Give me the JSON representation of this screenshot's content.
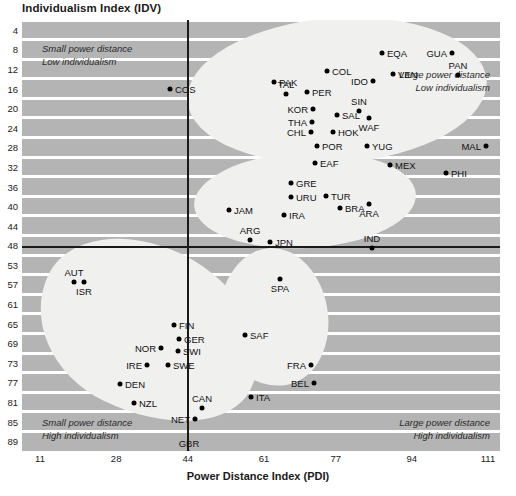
{
  "chart_data": {
    "type": "scatter",
    "title": "Individualism Index (IDV)",
    "xlabel": "Power Distance Index (PDI)",
    "ylabel": "Individualism Index (IDV)",
    "xticks": [
      "11",
      "28",
      "44",
      "61",
      "77",
      "94",
      "111"
    ],
    "yticks": [
      "4",
      "8",
      "12",
      "16",
      "20",
      "24",
      "28",
      "32",
      "36",
      "40",
      "44",
      "48",
      "53",
      "57",
      "61",
      "65",
      "69",
      "73",
      "77",
      "81",
      "85",
      "89"
    ],
    "xlim": [
      11,
      111
    ],
    "ylim": [
      4,
      89
    ],
    "grid": "horizontal-banded",
    "legend": "none",
    "annotations": [
      {
        "id": "q-top-left",
        "line1": "Small power distance",
        "line2": "Low individualism",
        "align": "left"
      },
      {
        "id": "q-top-right",
        "line1": "Large power distance",
        "line2": "Low individualism",
        "align": "right"
      },
      {
        "id": "q-bottom-left",
        "line1": "Small power distance",
        "line2": "High individualism",
        "align": "left"
      },
      {
        "id": "q-bottom-right",
        "line1": "Large power distance",
        "line2": "High individualism",
        "align": "right"
      }
    ],
    "divider_x": 44,
    "divider_y": 48,
    "clusters": [
      {
        "name": "large-power-distance-low-individualism",
        "members": [
          "PAK",
          "TAL",
          "PER",
          "COL",
          "EQA",
          "IDO",
          "VEN",
          "GUA",
          "PAN",
          "KOR",
          "SIN",
          "SAL",
          "THA",
          "WAF",
          "CHL",
          "HOK",
          "POR",
          "YUG",
          "MAL",
          "EAF"
        ]
      },
      {
        "name": "mid-cluster",
        "members": [
          "GRE",
          "URU",
          "TUR",
          "BRA",
          "ARA",
          "JAM",
          "IRA",
          "ARG",
          "JPN",
          "IND"
        ]
      },
      {
        "name": "small-power-distance-high-individualism",
        "members": [
          "AUT",
          "ISR",
          "FIN",
          "GER",
          "NOR",
          "SWI",
          "IRE",
          "SWE",
          "DEN",
          "NZL",
          "CAN",
          "NET",
          "GBR",
          "AUL",
          "USA"
        ]
      },
      {
        "name": "large-power-distance-high-individualism",
        "members": [
          "SPA",
          "SAF",
          "FRA",
          "BEL",
          "ITA"
        ]
      }
    ],
    "points": [
      {
        "label": "COS",
        "x": 148,
        "y": 69,
        "lp": "r"
      },
      {
        "label": "EQA",
        "x": 360,
        "y": 33,
        "lp": "r"
      },
      {
        "label": "GUA",
        "x": 430,
        "y": 33,
        "lp": "l"
      },
      {
        "label": "COL",
        "x": 305,
        "y": 51,
        "lp": "r"
      },
      {
        "label": "VEN",
        "x": 371,
        "y": 54,
        "lp": "r"
      },
      {
        "label": "PAN",
        "x": 436,
        "y": 55,
        "lp": "t"
      },
      {
        "label": "IDO",
        "x": 351,
        "y": 61,
        "lp": "l"
      },
      {
        "label": "PAK",
        "x": 252,
        "y": 62,
        "lp": "r"
      },
      {
        "label": "TAL",
        "x": 264,
        "y": 74,
        "lp": "t"
      },
      {
        "label": "PER",
        "x": 285,
        "y": 72,
        "lp": "r"
      },
      {
        "label": "KOR",
        "x": 291,
        "y": 89,
        "lp": "l"
      },
      {
        "label": "SIN",
        "x": 337,
        "y": 91,
        "lp": "t"
      },
      {
        "label": "SAL",
        "x": 315,
        "y": 95,
        "lp": "r"
      },
      {
        "label": "THA",
        "x": 290,
        "y": 102,
        "lp": "l"
      },
      {
        "label": "WAF",
        "x": 347,
        "y": 98,
        "lp": "b"
      },
      {
        "label": "CHL",
        "x": 289,
        "y": 112,
        "lp": "l"
      },
      {
        "label": "HOK",
        "x": 311,
        "y": 112,
        "lp": "r"
      },
      {
        "label": "POR",
        "x": 295,
        "y": 126,
        "lp": "r"
      },
      {
        "label": "YUG",
        "x": 345,
        "y": 126,
        "lp": "r"
      },
      {
        "label": "MAL",
        "x": 464,
        "y": 126,
        "lp": "l"
      },
      {
        "label": "EAF",
        "x": 293,
        "y": 143,
        "lp": "r"
      },
      {
        "label": "MEX",
        "x": 368,
        "y": 145,
        "lp": "r"
      },
      {
        "label": "PHI",
        "x": 424,
        "y": 153,
        "lp": "r"
      },
      {
        "label": "GRE",
        "x": 269,
        "y": 163,
        "lp": "r"
      },
      {
        "label": "URU",
        "x": 269,
        "y": 177,
        "lp": "r"
      },
      {
        "label": "TUR",
        "x": 304,
        "y": 176,
        "lp": "r"
      },
      {
        "label": "BRA",
        "x": 318,
        "y": 188,
        "lp": "r"
      },
      {
        "label": "ARA",
        "x": 347,
        "y": 184,
        "lp": "b"
      },
      {
        "label": "JAM",
        "x": 207,
        "y": 190,
        "lp": "r"
      },
      {
        "label": "IRA",
        "x": 262,
        "y": 195,
        "lp": "r"
      },
      {
        "label": "ARG",
        "x": 228,
        "y": 220,
        "lp": "t"
      },
      {
        "label": "JPN",
        "x": 248,
        "y": 222,
        "lp": "r"
      },
      {
        "label": "IND",
        "x": 350,
        "y": 228,
        "lp": "t"
      },
      {
        "label": "AUT",
        "x": 52,
        "y": 262,
        "lp": "t"
      },
      {
        "label": "ISR",
        "x": 62,
        "y": 262,
        "lp": "b"
      },
      {
        "label": "SPA",
        "x": 258,
        "y": 259,
        "lp": "b"
      },
      {
        "label": "FIN",
        "x": 152,
        "y": 305,
        "lp": "r"
      },
      {
        "label": "SAF",
        "x": 223,
        "y": 315,
        "lp": "r"
      },
      {
        "label": "GER",
        "x": 157,
        "y": 319,
        "lp": "r"
      },
      {
        "label": "NOR",
        "x": 139,
        "y": 328,
        "lp": "l"
      },
      {
        "label": "SWI",
        "x": 156,
        "y": 331,
        "lp": "r"
      },
      {
        "label": "IRE",
        "x": 125,
        "y": 345,
        "lp": "l"
      },
      {
        "label": "SWE",
        "x": 146,
        "y": 345,
        "lp": "r"
      },
      {
        "label": "FRA",
        "x": 289,
        "y": 345,
        "lp": "l"
      },
      {
        "label": "DEN",
        "x": 98,
        "y": 364,
        "lp": "r"
      },
      {
        "label": "BEL",
        "x": 292,
        "y": 363,
        "lp": "l"
      },
      {
        "label": "ITA",
        "x": 229,
        "y": 377,
        "lp": "r"
      },
      {
        "label": "NZL",
        "x": 112,
        "y": 383,
        "lp": "r"
      },
      {
        "label": "CAN",
        "x": 180,
        "y": 388,
        "lp": "t"
      },
      {
        "label": "NET",
        "x": 173,
        "y": 399,
        "lp": "l"
      },
      {
        "label": "GBR",
        "x": 167,
        "y": 433,
        "lp": "t"
      },
      {
        "label": "AUL",
        "x": 160,
        "y": 443,
        "lp": "l"
      },
      {
        "label": "USA",
        "x": 182,
        "y": 443,
        "lp": "t"
      }
    ]
  },
  "colors": {
    "plot_background": "#b4b4b4",
    "band": "#ffffff",
    "blob": "#f0f0ef",
    "point": "#000000",
    "axis_line": "#1a1a1a",
    "text": "#1a1a1a"
  }
}
